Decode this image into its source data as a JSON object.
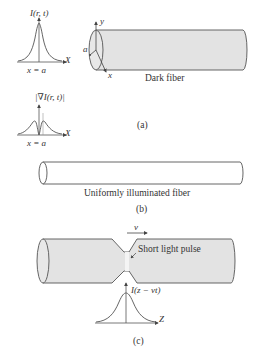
{
  "panel_a": {
    "intensity_plot": {
      "y_label": "I(r, t)",
      "x_axis": "X",
      "marker": "x = a"
    },
    "gradient_plot": {
      "y_label": "|∇I(r, t)|",
      "x_axis": "X",
      "marker": "x = a"
    },
    "fiber": {
      "label": "Dark fiber",
      "axis_y": "y",
      "axis_x": "x",
      "radius": "a"
    },
    "caption": "(a)"
  },
  "panel_b": {
    "fiber": {
      "label": "Uniformly illuminated fiber"
    },
    "caption": "(b)"
  },
  "panel_c": {
    "velocity": "v",
    "pulse_label": "Short light pulse",
    "pulse_plot": {
      "y_label": "I(z − vt)",
      "x_axis": "Z"
    },
    "caption": "(c)"
  },
  "colors": {
    "fiber_fill": "#e3e3e3",
    "stroke": "#555555",
    "background": "#ffffff"
  }
}
